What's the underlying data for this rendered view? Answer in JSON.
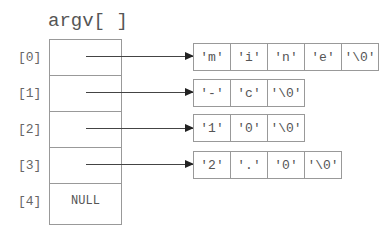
{
  "title": "argv[ ]",
  "indices": [
    "[0]",
    "[1]",
    "[2]",
    "[3]",
    "[4]"
  ],
  "null_label": "NULL",
  "strings": [
    [
      "'m'",
      "'i'",
      "'n'",
      "'e'",
      "'\\0'"
    ],
    [
      "'-'",
      "'c'",
      "'\\0'"
    ],
    [
      "'1'",
      "'0'",
      "'\\0'"
    ],
    [
      "'2'",
      "'.'",
      "'0'",
      "'\\0'"
    ]
  ]
}
